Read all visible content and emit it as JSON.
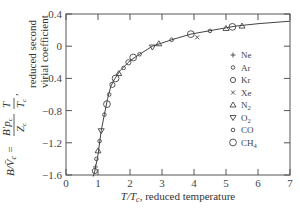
{
  "chart_data": {
    "type": "line",
    "title": "",
    "xlabel": "T/T_c, reduced temperature",
    "ylabel": "B/V̄_c = (B'p_c/Z_c)(T/T_c), reduced second virial coefficient",
    "xlim": [
      0,
      7
    ],
    "ylim": [
      -1.6,
      0.4
    ],
    "x_ticks": [
      "0",
      "1",
      "2",
      "3",
      "4",
      "5",
      "6",
      "7"
    ],
    "y_ticks": [
      "0.4",
      "0",
      "−0.4",
      "−0.8",
      "−1.2",
      "−1.6"
    ],
    "grid": false,
    "legend_position": "inside-right",
    "legend": [
      {
        "label": "Ne",
        "marker": "+"
      },
      {
        "label": "Ar",
        "marker": "o-small"
      },
      {
        "label": "Kr",
        "marker": "o-medium"
      },
      {
        "label": "Xe",
        "marker": "x"
      },
      {
        "label": "N2",
        "marker": "triangle-up"
      },
      {
        "label": "O2",
        "marker": "triangle-down"
      },
      {
        "label": "CO",
        "marker": "o-small"
      },
      {
        "label": "CH4",
        "marker": "o-large"
      }
    ],
    "series": [
      {
        "name": "fitted curve",
        "x": [
          0.85,
          0.9,
          1.0,
          1.1,
          1.2,
          1.3,
          1.4,
          1.5,
          1.7,
          2.0,
          2.3,
          2.7,
          3.3,
          3.9,
          4.6,
          5.3,
          6.0,
          7.0
        ],
        "y": [
          -1.62,
          -1.55,
          -1.35,
          -1.05,
          -0.85,
          -0.65,
          -0.5,
          -0.42,
          -0.3,
          -0.18,
          -0.1,
          0.0,
          0.08,
          0.15,
          0.2,
          0.25,
          0.28,
          0.31
        ]
      },
      {
        "name": "data points",
        "points": [
          {
            "x": 0.9,
            "y": -1.55,
            "marker": "o-medium"
          },
          {
            "x": 0.92,
            "y": -1.5,
            "marker": "+"
          },
          {
            "x": 0.95,
            "y": -1.4,
            "marker": "o-small"
          },
          {
            "x": 1.0,
            "y": -1.3,
            "marker": "triangle-up"
          },
          {
            "x": 1.05,
            "y": -1.18,
            "marker": "o-small"
          },
          {
            "x": 1.1,
            "y": -1.05,
            "marker": "triangle-down"
          },
          {
            "x": 1.2,
            "y": -0.85,
            "marker": "o-small"
          },
          {
            "x": 1.28,
            "y": -0.72,
            "marker": "o-large"
          },
          {
            "x": 1.35,
            "y": -0.6,
            "marker": "o-small"
          },
          {
            "x": 1.45,
            "y": -0.48,
            "marker": "o-medium"
          },
          {
            "x": 1.55,
            "y": -0.4,
            "marker": "o-large"
          },
          {
            "x": 1.65,
            "y": -0.34,
            "marker": "triangle-up"
          },
          {
            "x": 1.8,
            "y": -0.27,
            "marker": "o-small"
          },
          {
            "x": 1.95,
            "y": -0.2,
            "marker": "o-medium"
          },
          {
            "x": 2.1,
            "y": -0.14,
            "marker": "o-large"
          },
          {
            "x": 2.3,
            "y": -0.1,
            "marker": "o-small"
          },
          {
            "x": 2.7,
            "y": -0.01,
            "marker": "triangle-down"
          },
          {
            "x": 2.9,
            "y": 0.03,
            "marker": "triangle-up"
          },
          {
            "x": 3.3,
            "y": 0.08,
            "marker": "o-small"
          },
          {
            "x": 3.9,
            "y": 0.15,
            "marker": "o-large"
          },
          {
            "x": 4.1,
            "y": 0.11,
            "marker": "x"
          },
          {
            "x": 4.5,
            "y": 0.19,
            "marker": "o-small"
          },
          {
            "x": 5.0,
            "y": 0.22,
            "marker": "triangle-up"
          },
          {
            "x": 5.2,
            "y": 0.24,
            "marker": "o-large"
          },
          {
            "x": 5.5,
            "y": 0.25,
            "marker": "triangle-up"
          }
        ]
      }
    ]
  },
  "labels": {
    "xlabel_main": "T/T",
    "xlabel_sub": "c",
    "xlabel_rest": ", reduced temperature",
    "ylabel_line1": "reduced second",
    "ylabel_line2": "virial coefficient"
  }
}
